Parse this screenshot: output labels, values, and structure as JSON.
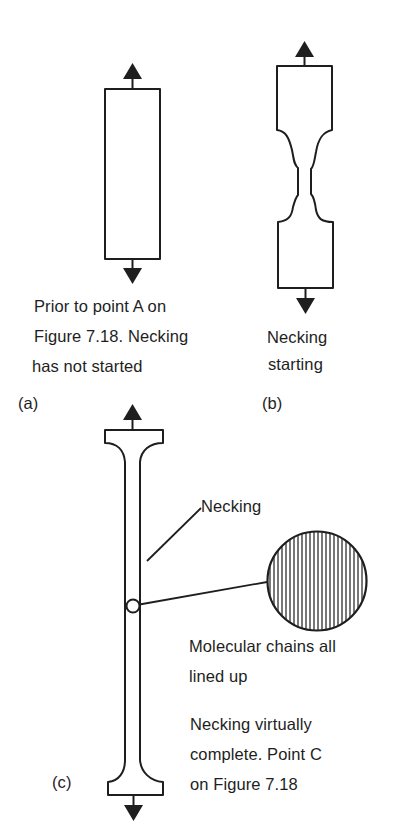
{
  "figure": {
    "panels": [
      {
        "id": "a",
        "tag": "(a)",
        "caption_lines": [
          "Prior to point A on",
          "Figure 7.18. Necking",
          "has not started"
        ]
      },
      {
        "id": "b",
        "tag": "(b)",
        "caption_lines": [
          "Necking",
          "starting"
        ]
      },
      {
        "id": "c",
        "tag": "(c)",
        "callout_necking": "Necking",
        "callout_chains_lines": [
          "Molecular chains all",
          "lined up"
        ],
        "caption_lines": [
          "Necking virtually",
          "complete. Point C",
          "on Figure 7.18"
        ]
      }
    ],
    "colors": {
      "ink": "#1e1e1e",
      "background": "#ffffff"
    }
  }
}
